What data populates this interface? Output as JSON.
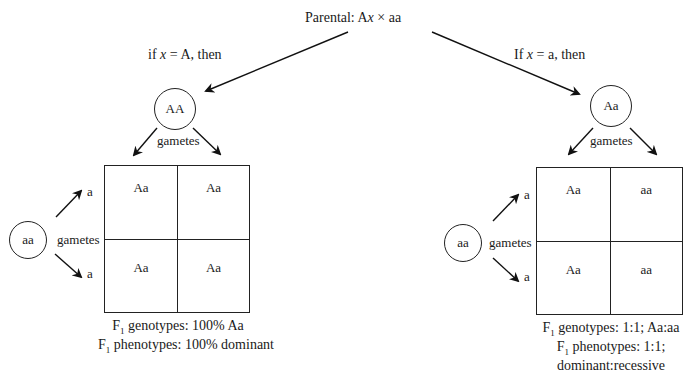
{
  "title": {
    "prefix": "Parental: A",
    "var": "x",
    "suffix": " × aa"
  },
  "left": {
    "condition": {
      "prefix": "if ",
      "var": "x",
      "suffix": " = A, then"
    },
    "parent_top": "AA",
    "gametes_label_top": "gametes",
    "parent_side": "aa",
    "gametes_label_side": "gametes",
    "side_gametes": [
      "a",
      "a"
    ],
    "punnett": [
      [
        "Aa",
        "Aa"
      ],
      [
        "Aa",
        "Aa"
      ]
    ],
    "results": [
      {
        "f": "F",
        "sub": "1",
        "text": " genotypes: 100% Aa"
      },
      {
        "f": "F",
        "sub": "1",
        "text": " phenotypes: 100% dominant"
      }
    ]
  },
  "right": {
    "condition": {
      "prefix": "If ",
      "var": "x",
      "suffix": " = a, then"
    },
    "parent_top": "Aa",
    "gametes_label_top": "gametes",
    "parent_side": "aa",
    "gametes_label_side": "gametes",
    "side_gametes": [
      "a",
      "a"
    ],
    "punnett": [
      [
        "Aa",
        "aa"
      ],
      [
        "Aa",
        "aa"
      ]
    ],
    "results": [
      {
        "f": "F",
        "sub": "1",
        "text": " genotypes: 1:1; Aa:aa"
      },
      {
        "f": "F",
        "sub": "1",
        "text": " phenotypes: 1:1;"
      },
      {
        "f": "",
        "sub": "",
        "text": "dominant:recessive"
      }
    ]
  }
}
